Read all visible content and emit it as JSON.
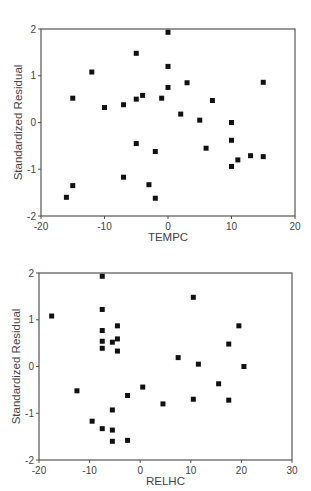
{
  "chart_data": [
    {
      "type": "scatter",
      "title": "",
      "xlabel": "TEMPC",
      "ylabel": "Standardized Residual",
      "xlim": [
        -20,
        20
      ],
      "ylim": [
        -2,
        2
      ],
      "xticks": [
        -20,
        -10,
        0,
        10,
        20
      ],
      "yticks": [
        -2,
        -1,
        0,
        1,
        2
      ],
      "grid": false,
      "legend": null,
      "marker": "square",
      "marker_color": "#111111",
      "points": [
        [
          -16,
          -1.6
        ],
        [
          -15,
          -1.35
        ],
        [
          -15,
          0.52
        ],
        [
          -12,
          1.08
        ],
        [
          -10,
          0.32
        ],
        [
          -7,
          0.38
        ],
        [
          -7,
          -1.17
        ],
        [
          -5,
          1.48
        ],
        [
          -5,
          0.5
        ],
        [
          -5,
          -0.45
        ],
        [
          -4,
          0.58
        ],
        [
          -3,
          -1.33
        ],
        [
          -2,
          -0.62
        ],
        [
          -2,
          -1.62
        ],
        [
          -1,
          0.52
        ],
        [
          0,
          1.93
        ],
        [
          0,
          1.2
        ],
        [
          0,
          0.75
        ],
        [
          2,
          0.18
        ],
        [
          3,
          0.85
        ],
        [
          5,
          0.05
        ],
        [
          6,
          -0.55
        ],
        [
          7,
          0.47
        ],
        [
          10,
          0.0
        ],
        [
          10,
          -0.38
        ],
        [
          10,
          -0.94
        ],
        [
          11,
          -0.8
        ],
        [
          13,
          -0.71
        ],
        [
          15,
          0.86
        ],
        [
          15,
          -0.73
        ]
      ]
    },
    {
      "type": "scatter",
      "title": "",
      "xlabel": "RELHC",
      "ylabel": "Standardized Residual",
      "xlim": [
        -20,
        30
      ],
      "ylim": [
        -2,
        2
      ],
      "xticks": [
        -20,
        -10,
        0,
        10,
        20,
        30
      ],
      "yticks": [
        -2,
        -1,
        0,
        1,
        2
      ],
      "grid": false,
      "legend": null,
      "marker": "square",
      "marker_color": "#111111",
      "points": [
        [
          -17.5,
          1.08
        ],
        [
          -12.5,
          -0.52
        ],
        [
          -9.5,
          -1.17
        ],
        [
          -7.5,
          1.93
        ],
        [
          -7.5,
          1.22
        ],
        [
          -7.5,
          0.77
        ],
        [
          -7.5,
          0.54
        ],
        [
          -7.5,
          0.39
        ],
        [
          -7.5,
          -1.33
        ],
        [
          -5.5,
          0.52
        ],
        [
          -5.5,
          -0.93
        ],
        [
          -5.5,
          -1.36
        ],
        [
          -5.5,
          -1.6
        ],
        [
          -4.5,
          0.87
        ],
        [
          -4.5,
          0.59
        ],
        [
          -4.5,
          0.33
        ],
        [
          -2.5,
          -0.62
        ],
        [
          -2.5,
          -1.58
        ],
        [
          0.5,
          -0.44
        ],
        [
          4.5,
          -0.8
        ],
        [
          7.5,
          0.19
        ],
        [
          10.5,
          1.48
        ],
        [
          10.5,
          -0.7
        ],
        [
          11.5,
          0.05
        ],
        [
          15.5,
          -0.37
        ],
        [
          17.5,
          0.48
        ],
        [
          17.5,
          -0.72
        ],
        [
          19.5,
          0.87
        ],
        [
          20.5,
          0.0
        ]
      ]
    }
  ],
  "plots": [
    {
      "xlabel": "TEMPC",
      "ylabel": "Standardized Residual"
    },
    {
      "xlabel": "RELHC",
      "ylabel": "Standardized Residual"
    }
  ]
}
